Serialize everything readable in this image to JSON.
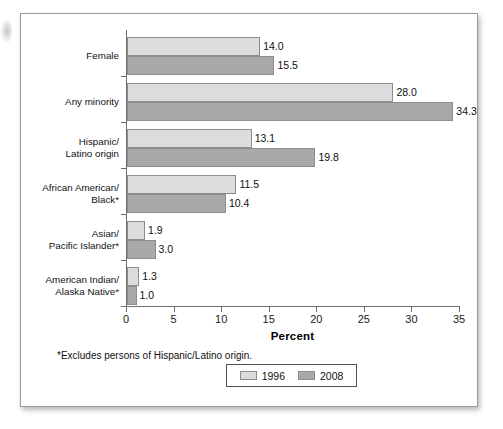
{
  "chart_data": {
    "type": "bar",
    "orientation": "horizontal",
    "title": "",
    "xlabel": "Percent",
    "ylabel": "",
    "xlim": [
      0,
      35
    ],
    "xticks": [
      0,
      5,
      10,
      15,
      20,
      25,
      30,
      35
    ],
    "xtick_labels": [
      "0",
      "5",
      "10",
      "15",
      "20",
      "25",
      "30",
      "35"
    ],
    "grid": false,
    "legend_position": "bottom-center",
    "categories": [
      "Female",
      "Any minority",
      "Hispanic/\nLatino origin",
      "African American/\nBlack*",
      "Asian/\nPacific Islander*",
      "American Indian/\nAlaska Native*"
    ],
    "series": [
      {
        "name": "1996",
        "color": "#dcdcdc",
        "values": [
          14.0,
          28.0,
          13.1,
          11.5,
          1.9,
          1.3
        ],
        "value_labels": [
          "14.0",
          "28.0",
          "13.1",
          "11.5",
          "1.9",
          "1.3"
        ]
      },
      {
        "name": "2008",
        "color": "#a9a9a9",
        "values": [
          15.5,
          34.3,
          19.8,
          10.4,
          3.0,
          1.0
        ],
        "value_labels": [
          "15.5",
          "34.3",
          "19.8",
          "10.4",
          "3.0",
          "1.0"
        ]
      }
    ],
    "footnote": "*Excludes persons of Hispanic/Latino origin."
  },
  "legend": {
    "entries": [
      {
        "label": "1996"
      },
      {
        "label": "2008"
      }
    ]
  },
  "axis": {
    "x_title": "Percent"
  }
}
